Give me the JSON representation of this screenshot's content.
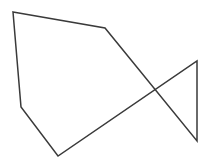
{
  "diagram": {
    "type": "polygon-line-drawing",
    "stroke_color": "#3a3a3a",
    "background_color": "#ffffff",
    "stroke_width": 1.5,
    "vertices": [
      {
        "x": 13,
        "y": 12
      },
      {
        "x": 105,
        "y": 28
      },
      {
        "x": 197,
        "y": 141
      },
      {
        "x": 197,
        "y": 61
      },
      {
        "x": 58,
        "y": 156
      },
      {
        "x": 21,
        "y": 107
      }
    ],
    "closed": true
  }
}
